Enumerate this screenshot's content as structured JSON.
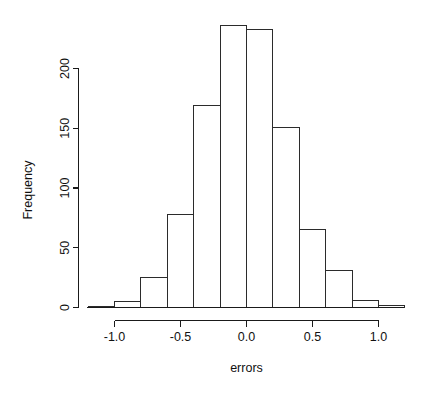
{
  "chart_data": {
    "type": "bar",
    "title": "",
    "subtitle": "",
    "xlabel": "errors",
    "ylabel": "Frequency",
    "xlim": [
      -1.2,
      1.2
    ],
    "ylim": [
      0,
      240
    ],
    "grid": false,
    "legend": null,
    "bin_width": 0.2,
    "bin_edges": [
      -1.2,
      -1.0,
      -0.8,
      -0.6,
      -0.4,
      -0.2,
      0.0,
      0.2,
      0.4,
      0.6,
      0.8,
      1.0,
      1.2
    ],
    "categories": [
      "-1.2 to -1.0",
      "-1.0 to -0.8",
      "-0.8 to -0.6",
      "-0.6 to -0.4",
      "-0.4 to -0.2",
      "-0.2 to 0.0",
      "0.0 to 0.2",
      "0.2 to 0.4",
      "0.4 to 0.6",
      "0.6 to 0.8",
      "0.8 to 1.0",
      "1.0 to 1.2"
    ],
    "values": [
      1,
      5,
      25,
      78,
      169,
      236,
      233,
      151,
      65,
      31,
      6,
      2
    ],
    "bin_centers": [
      -1.1,
      -0.9,
      -0.7,
      -0.5,
      -0.3,
      -0.1,
      0.1,
      0.3,
      0.5,
      0.7,
      0.9,
      1.1
    ],
    "x_ticks": [
      -1.0,
      -0.5,
      0.0,
      0.5,
      1.0
    ],
    "x_tick_labels": [
      "-1.0",
      "-0.5",
      "0.0",
      "0.5",
      "1.0"
    ],
    "y_ticks": [
      0,
      50,
      100,
      150,
      200
    ],
    "y_tick_labels": [
      "0",
      "50",
      "100",
      "150",
      "200"
    ],
    "colors": {
      "bar_fill": "#ffffff",
      "bar_stroke": "#2b2b2b",
      "axis": "#1a1a1a",
      "text": "#111111",
      "background": "#ffffff"
    }
  },
  "axes": {
    "x_title": "errors",
    "y_title": "Frequency"
  }
}
